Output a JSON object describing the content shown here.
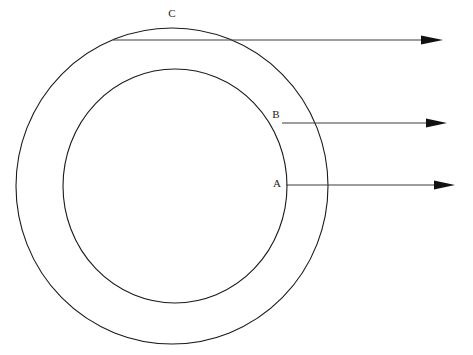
{
  "figure": {
    "title": "",
    "background_color": "#ffffff",
    "stroke_color": "#1a1a1a",
    "leader_color": "#3d3d3d",
    "width": 473,
    "height": 355
  },
  "shapes": {
    "outer_circle": {
      "name": "outer-ring-circle",
      "cx": 172,
      "cy": 186,
      "rx": 156,
      "ry": 158
    },
    "inner_circle": {
      "name": "inner-ring-circle",
      "cx": 175,
      "cy": 186,
      "rx": 112,
      "ry": 117
    }
  },
  "annotations": [
    {
      "id": "callout-c",
      "label": "C",
      "label_x": 172,
      "label_y": 14,
      "line_start_x": 113,
      "line_start_y": 40,
      "line_end_x": 421,
      "line_end_y": 40,
      "arrow_tip_x": 443,
      "arrow_tip_y": 40
    },
    {
      "id": "callout-b",
      "label": "B",
      "label_x": 276,
      "label_y": 115,
      "line_start_x": 282,
      "line_start_y": 123,
      "line_end_x": 426,
      "line_end_y": 123,
      "arrow_tip_x": 447,
      "arrow_tip_y": 123
    },
    {
      "id": "callout-a",
      "label": "A",
      "label_x": 277,
      "label_y": 184,
      "line_start_x": 286,
      "line_start_y": 185,
      "line_end_x": 434,
      "line_end_y": 185,
      "arrow_tip_x": 455,
      "arrow_tip_y": 185
    }
  ]
}
